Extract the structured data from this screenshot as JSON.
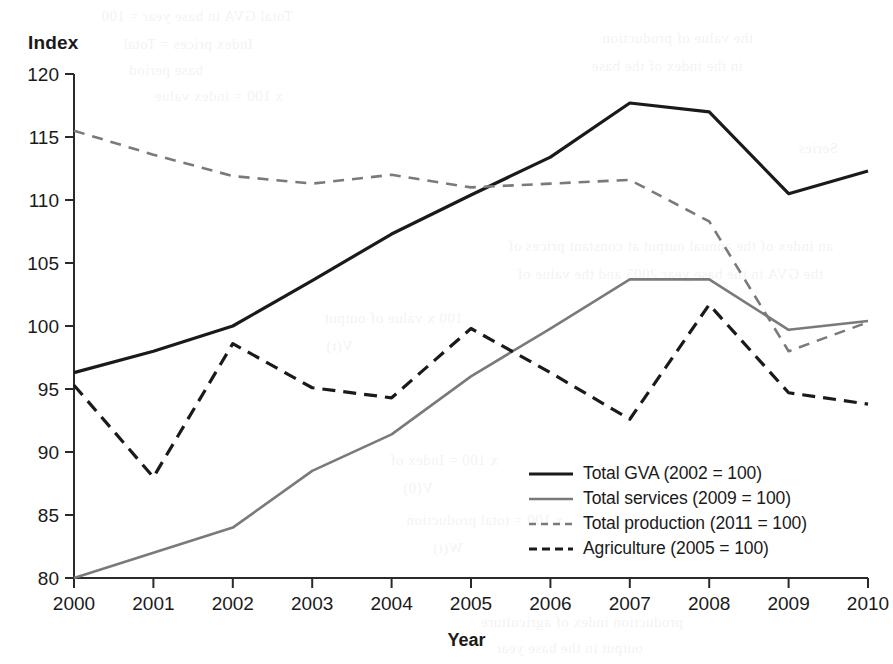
{
  "chart_data": {
    "type": "line",
    "title": "",
    "xlabel": "Year",
    "ylabel": "Index",
    "x": [
      2000,
      2001,
      2002,
      2003,
      2004,
      2005,
      2006,
      2007,
      2008,
      2009,
      2010
    ],
    "xlim": [
      2000,
      2010
    ],
    "ylim": [
      80,
      120
    ],
    "yticks": [
      80,
      85,
      90,
      95,
      100,
      105,
      110,
      115,
      120
    ],
    "xticks": [
      "2000",
      "2001",
      "2002",
      "2003",
      "2004",
      "2005",
      "2006",
      "2007",
      "2008",
      "2009",
      "2010"
    ],
    "grid": false,
    "legend_position": "center-right",
    "series": [
      {
        "name": "Total GVA (2002 = 100)",
        "style": "solid",
        "color": "#1a1a1a",
        "width": 3.2,
        "values": [
          96.3,
          98.0,
          100.0,
          103.6,
          107.3,
          110.4,
          113.4,
          117.7,
          117.0,
          110.5,
          112.3
        ]
      },
      {
        "name": "Total services (2009 = 100)",
        "style": "solid",
        "color": "#7a7a7a",
        "width": 2.6,
        "values": [
          80.0,
          82.0,
          84.0,
          88.5,
          91.4,
          96.0,
          99.8,
          103.7,
          103.7,
          99.7,
          100.4
        ]
      },
      {
        "name": "Total production (2011 = 100)",
        "style": "dashed",
        "color": "#7a7a7a",
        "width": 2.6,
        "values": [
          115.5,
          113.6,
          111.9,
          111.3,
          112.0,
          111.0,
          111.3,
          111.6,
          108.3,
          98.0,
          100.3
        ]
      },
      {
        "name": "Agriculture (2005 = 100)",
        "style": "dashed",
        "color": "#1a1a1a",
        "width": 3.2,
        "values": [
          95.3,
          88.0,
          98.6,
          95.1,
          94.3,
          99.8,
          96.3,
          92.6,
          101.7,
          94.7,
          93.8
        ]
      }
    ]
  },
  "axes": {
    "y_title": "Index",
    "x_title": "Year"
  },
  "legend": {
    "items": [
      {
        "label": "Total GVA (2002 = 100)"
      },
      {
        "label": "Total services (2009 = 100)"
      },
      {
        "label": "Total production (2011 = 100)"
      },
      {
        "label": "Agriculture (2005 = 100)"
      }
    ]
  },
  "bleed_through": [
    {
      "text": "Total GVA in base year = 100",
      "x": 600,
      "y": 8
    },
    {
      "text": "Index prices = Total",
      "x": 640,
      "y": 36
    },
    {
      "text": "base period",
      "x": 690,
      "y": 62
    },
    {
      "text": "x 100 = index value",
      "x": 610,
      "y": 88
    },
    {
      "text": "the value of production",
      "x": 140,
      "y": 30
    },
    {
      "text": "in the index of the base",
      "x": 150,
      "y": 58
    },
    {
      "text": "Series",
      "x": 55,
      "y": 140
    },
    {
      "text": "an index of the annual output at constant prices of",
      "x": 60,
      "y": 238
    },
    {
      "text": "the GVA in the base year 2005 and the value of",
      "x": 70,
      "y": 266
    },
    {
      "text": "100 x value of output",
      "x": 430,
      "y": 310
    },
    {
      "text": "V(t)",
      "x": 540,
      "y": 338
    },
    {
      "text": "x 100 = Index of",
      "x": 395,
      "y": 452
    },
    {
      "text": "V(0)",
      "x": 460,
      "y": 480
    },
    {
      "text": "x 100 = total production",
      "x": 330,
      "y": 512
    },
    {
      "text": "W(t)",
      "x": 430,
      "y": 540
    },
    {
      "text": "production index of agriculture",
      "x": 210,
      "y": 614
    },
    {
      "text": "output in the base year",
      "x": 250,
      "y": 640
    }
  ]
}
